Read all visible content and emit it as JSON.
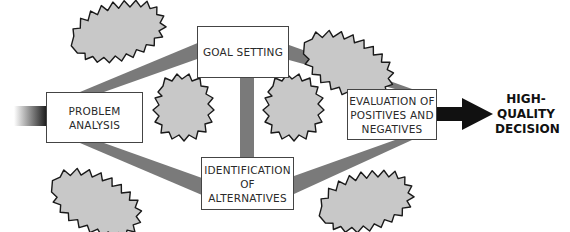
{
  "diagram": {
    "title": "",
    "steps": {
      "problem_analysis": {
        "line1": "PROBLEM",
        "line2": "ANALYSIS"
      },
      "goal_setting": {
        "line1": "GOAL SETTING"
      },
      "identification": {
        "line1": "IDENTIFICATION",
        "line2": "OF",
        "line3": "ALTERNATIVES"
      },
      "evaluation": {
        "line1": "EVALUATION OF",
        "line2": "POSITIVES AND",
        "line3": "NEGATIVES"
      }
    },
    "outcome": {
      "line1": "HIGH-",
      "line2": "QUALITY",
      "line3": "DECISION"
    },
    "colors": {
      "connector": "#7a7a7a",
      "cloud_fill": "#c8c8c8",
      "cloud_stroke": "#1a1a1a",
      "arrow": "#111111",
      "box_border": "#444444"
    }
  }
}
